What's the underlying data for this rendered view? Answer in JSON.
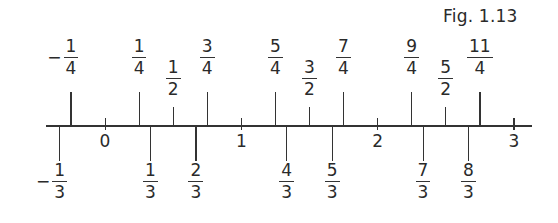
{
  "figure": {
    "caption": "Fig. 1.13",
    "type": "number-line",
    "axis": {
      "min_shown": -0.43,
      "max_shown": 3.1,
      "integer_ticks": [
        "0",
        "1",
        "2",
        "3"
      ]
    },
    "above_labels": [
      {
        "value": -0.25,
        "sign": "−",
        "num": "1",
        "den": "4",
        "kind": "quarter"
      },
      {
        "value": 0.25,
        "sign": "",
        "num": "1",
        "den": "4",
        "kind": "quarter"
      },
      {
        "value": 0.5,
        "sign": "",
        "num": "1",
        "den": "2",
        "kind": "half"
      },
      {
        "value": 0.75,
        "sign": "",
        "num": "3",
        "den": "4",
        "kind": "quarter"
      },
      {
        "value": 1.25,
        "sign": "",
        "num": "5",
        "den": "4",
        "kind": "quarter"
      },
      {
        "value": 1.5,
        "sign": "",
        "num": "3",
        "den": "2",
        "kind": "half"
      },
      {
        "value": 1.75,
        "sign": "",
        "num": "7",
        "den": "4",
        "kind": "quarter"
      },
      {
        "value": 2.25,
        "sign": "",
        "num": "9",
        "den": "4",
        "kind": "quarter"
      },
      {
        "value": 2.5,
        "sign": "",
        "num": "5",
        "den": "2",
        "kind": "half"
      },
      {
        "value": 2.75,
        "sign": "",
        "num": "11",
        "den": "4",
        "kind": "quarter"
      }
    ],
    "below_labels": [
      {
        "value": -0.3333,
        "sign": "−",
        "num": "1",
        "den": "3"
      },
      {
        "value": 0.3333,
        "sign": "",
        "num": "1",
        "den": "3"
      },
      {
        "value": 0.6667,
        "sign": "",
        "num": "2",
        "den": "3"
      },
      {
        "value": 1.3333,
        "sign": "",
        "num": "4",
        "den": "3"
      },
      {
        "value": 1.6667,
        "sign": "",
        "num": "5",
        "den": "3"
      },
      {
        "value": 2.3333,
        "sign": "",
        "num": "7",
        "den": "3"
      },
      {
        "value": 2.6667,
        "sign": "",
        "num": "8",
        "den": "3"
      }
    ]
  }
}
